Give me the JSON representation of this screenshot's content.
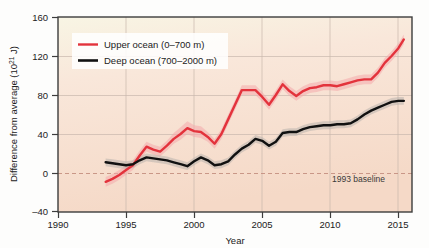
{
  "figure": {
    "background_color": "#fdfdfc",
    "plot_fill_top": "#f7f3e2",
    "plot_fill_bottom": "#f6dbca",
    "frame_color": "#3d3d3d",
    "grid_color": "#c9b7ad",
    "baseline_color": "#c48f7f"
  },
  "chart_data": {
    "type": "line",
    "title": "",
    "xlabel": "Year",
    "ylabel": "Difference from average (10²¹ J)",
    "ylabel_main": "Difference from average (10",
    "ylabel_exp": "21",
    "ylabel_tail": " J)",
    "xlim": [
      1990,
      2016
    ],
    "ylim": [
      -40,
      160
    ],
    "xticks": [
      1990,
      1995,
      2000,
      2005,
      2010,
      2015
    ],
    "yticks": [
      -40,
      0,
      40,
      80,
      120,
      160
    ],
    "grid": true,
    "legend_position": "upper-left",
    "annotations": [
      {
        "text": "1993 baseline",
        "x": 2011.2,
        "y": -14
      }
    ],
    "baseline": {
      "value": 0,
      "label": "1993 baseline",
      "style": "dashed"
    },
    "series": [
      {
        "name": "Upper ocean (0–700 m)",
        "color": "#e3333c",
        "band_color": "#f4a9ab",
        "x": [
          1993.5,
          1994,
          1994.5,
          1995,
          1995.5,
          1996,
          1996.5,
          1997,
          1997.5,
          1998,
          1998.5,
          1999,
          1999.5,
          2000,
          2000.5,
          2001,
          2001.5,
          2002,
          2002.5,
          2003,
          2003.5,
          2004,
          2004.5,
          2005,
          2005.5,
          2006,
          2006.5,
          2007,
          2007.5,
          2008,
          2008.5,
          2009,
          2009.5,
          2010,
          2010.5,
          2011,
          2011.5,
          2012,
          2012.5,
          2013,
          2013.5,
          2014,
          2014.5,
          2015,
          2015.4
        ],
        "y": [
          -9,
          -6,
          -2,
          3,
          8,
          18,
          27,
          24,
          22,
          28,
          35,
          40,
          46,
          43,
          42,
          37,
          30,
          40,
          55,
          70,
          85,
          85,
          85,
          78,
          70,
          80,
          91,
          84,
          79,
          84,
          87,
          88,
          90,
          90,
          89,
          91,
          93,
          95,
          96,
          96,
          103,
          113,
          120,
          128,
          137
        ],
        "band_lower": [
          -14,
          -11,
          -7,
          -2,
          3,
          13,
          22,
          19,
          17,
          23,
          30,
          34,
          40,
          37,
          36,
          32,
          25,
          35,
          50,
          65,
          80,
          80,
          80,
          73,
          65,
          75,
          86,
          79,
          74,
          79,
          82,
          83,
          85,
          85,
          84,
          86,
          88,
          90,
          91,
          91,
          98,
          108,
          115,
          123,
          132
        ],
        "band_upper": [
          -4,
          -1,
          3,
          8,
          13,
          23,
          32,
          29,
          27,
          33,
          41,
          47,
          53,
          49,
          48,
          42,
          35,
          45,
          60,
          75,
          90,
          90,
          90,
          83,
          75,
          85,
          96,
          89,
          84,
          89,
          92,
          93,
          95,
          95,
          94,
          96,
          98,
          100,
          101,
          101,
          108,
          118,
          125,
          133,
          142
        ]
      },
      {
        "name": "Deep ocean (700–2000 m)",
        "color": "#111111",
        "band_color": "#b9b2ad",
        "x": [
          1993.5,
          1994,
          1994.5,
          1995,
          1995.5,
          1996,
          1996.5,
          1997,
          1997.5,
          1998,
          1998.5,
          1999,
          1999.5,
          2000,
          2000.5,
          2001,
          2001.5,
          2002,
          2002.5,
          2003,
          2003.5,
          2004,
          2004.5,
          2005,
          2005.5,
          2006,
          2006.5,
          2007,
          2007.5,
          2008,
          2008.5,
          2009,
          2009.5,
          2010,
          2010.5,
          2011,
          2011.5,
          2012,
          2012.5,
          2013,
          2013.5,
          2014,
          2014.5,
          2015,
          2015.4
        ],
        "y": [
          11,
          10,
          9,
          8,
          9,
          13,
          16,
          15,
          14,
          13,
          11,
          9,
          7,
          12,
          16,
          13,
          8,
          9,
          12,
          19,
          25,
          29,
          35,
          33,
          28,
          32,
          41,
          42,
          42,
          45,
          47,
          48,
          49,
          49,
          50,
          50,
          51,
          55,
          60,
          64,
          67,
          70,
          73,
          74,
          74
        ],
        "band_lower": [
          7,
          6,
          5,
          4,
          5,
          9,
          12,
          11,
          10,
          9,
          7,
          5,
          3,
          8,
          12,
          9,
          4,
          5,
          8,
          15,
          21,
          25,
          31,
          29,
          24,
          28,
          37,
          38,
          38,
          41,
          43,
          44,
          45,
          45,
          46,
          46,
          47,
          51,
          56,
          60,
          63,
          66,
          69,
          70,
          70
        ],
        "band_upper": [
          15,
          14,
          13,
          12,
          13,
          17,
          20,
          19,
          18,
          17,
          15,
          13,
          11,
          16,
          20,
          17,
          12,
          13,
          16,
          23,
          29,
          33,
          39,
          37,
          32,
          36,
          45,
          46,
          46,
          49,
          51,
          52,
          53,
          53,
          54,
          54,
          55,
          59,
          64,
          68,
          71,
          74,
          77,
          78,
          78
        ]
      }
    ]
  },
  "legend": {
    "items": [
      {
        "label": "Upper ocean (0–700 m)",
        "color": "#e3333c"
      },
      {
        "label": "Deep ocean (700–2000 m)",
        "color": "#111111"
      }
    ]
  },
  "axis": {
    "x_tick_labels": [
      "1990",
      "1995",
      "2000",
      "2005",
      "2010",
      "2015"
    ],
    "y_tick_labels": [
      "160",
      "120",
      "80",
      "40",
      "0",
      "–40"
    ],
    "x_title": "Year"
  }
}
